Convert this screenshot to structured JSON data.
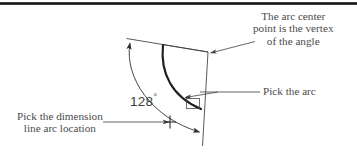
{
  "figure": {
    "type": "technical-diagram",
    "background_color": "#ffffff",
    "line_color": "#3c3c3c",
    "text_color": "#4a4a4a",
    "top_rule_color": "#1a1a1a"
  },
  "annotations": {
    "arc_center": {
      "name": "arc-center-note",
      "lines": [
        "The arc center",
        "point is the vertex",
        "of the angle"
      ],
      "align": "center",
      "leader": "points down-left to the angle vertex"
    },
    "pick_arc": {
      "name": "pick-arc-note",
      "lines": [
        "Pick the arc"
      ],
      "align": "left",
      "leader": "points left to a small pick box on the arc"
    },
    "dimension_location": {
      "name": "dimension-location-note",
      "lines": [
        "Pick the dimension",
        "line arc location"
      ],
      "align": "center",
      "leader": "points right to a cross marker on the dimension arc"
    }
  },
  "measurements": {
    "angle_label": "128",
    "angle_symbol": "°",
    "angle_full": "128°"
  },
  "geometry": {
    "vertex": {
      "x": 208,
      "y": 52
    },
    "left_ray_end": {
      "x": 127,
      "y": 39
    },
    "right_ray_end": {
      "x": 203,
      "y": 146
    },
    "main_arc": {
      "start_x": 163,
      "start_y": 45,
      "end_x": 200,
      "end_y": 109
    },
    "dimension_arc": {
      "start_x": 129,
      "start_y": 42,
      "end_x": 200,
      "end_y": 132
    },
    "pick_box": {
      "x": 186,
      "y": 98,
      "w": 13,
      "h": 10
    },
    "cross_marker": {
      "x": 170,
      "y": 122
    }
  }
}
